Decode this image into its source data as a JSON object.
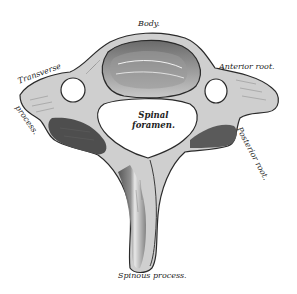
{
  "figure": {
    "colors": {
      "bone_light": "#e9e9e9",
      "bone_mid": "#a8a8a8",
      "bone_dark": "#5a5a5a",
      "outline": "#2a2a2a",
      "background": "#ffffff"
    },
    "labels": {
      "body": "Body.",
      "anterior_root": "Anterior root.",
      "transverse": "Transverse",
      "process": "process.",
      "spinal_line1": "Spinal",
      "spinal_line2": "foramen.",
      "posterior_root": "Posterior root.",
      "spinous_process": "Spinous process."
    }
  }
}
